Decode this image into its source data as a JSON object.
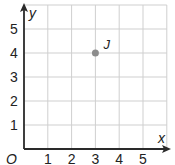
{
  "chart_data": {
    "type": "scatter",
    "title": "",
    "xlabel": "x",
    "ylabel": "y",
    "origin_label": "O",
    "xlim": [
      0,
      6
    ],
    "ylim": [
      0,
      6
    ],
    "x_ticks": [
      "1",
      "2",
      "3",
      "4",
      "5"
    ],
    "y_ticks": [
      "1",
      "2",
      "3",
      "4",
      "5"
    ],
    "grid": true,
    "points": [
      {
        "label": "J",
        "x": 3,
        "y": 4
      }
    ],
    "colors": {
      "grid": "#cfcfcf",
      "axis": "#2a2a2a",
      "point": "#8c8c8c"
    }
  }
}
